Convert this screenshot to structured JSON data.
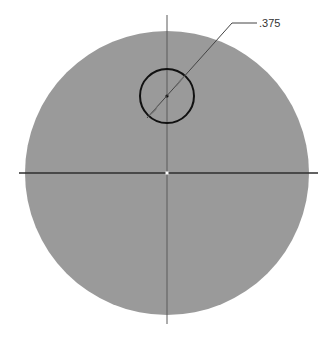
{
  "drawing": {
    "type": "cad-sketch",
    "colors": {
      "background": "#ffffff",
      "disk_fill": "#9a9a9a",
      "centerline": "#2e2e2e",
      "hole_outline": "#111111",
      "dimension_line": "#444444",
      "text": "#333333"
    },
    "outer_circle": {
      "cx": 167,
      "cy": 173,
      "r": 142
    },
    "hole": {
      "cx": 167,
      "cy": 96,
      "r": 27
    },
    "centerlines": {
      "horizontal": {
        "x1": 19,
        "x2": 318,
        "y": 173
      },
      "vertical": {
        "x": 167,
        "y1": 15,
        "y2": 324
      }
    },
    "dimension": {
      "label": ".375",
      "type": "diameter",
      "leader_start": {
        "x": 147,
        "y": 118
      },
      "leader_elbow": {
        "x": 232,
        "y": 23
      },
      "leader_end": {
        "x": 257,
        "y": 23
      },
      "text_x": 259,
      "text_y": 27
    }
  }
}
